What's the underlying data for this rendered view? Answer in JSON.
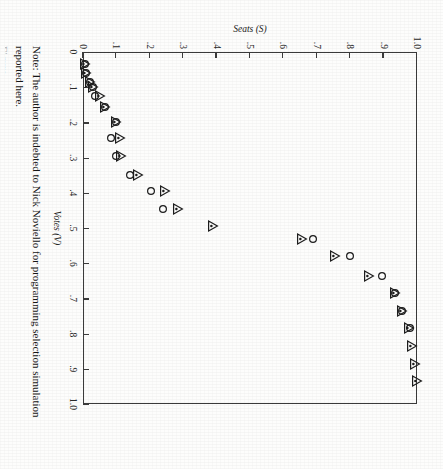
{
  "figure": {
    "note_line1": "Note: The author is indebted to Nick Noviello for programming selection simulation reported here.",
    "note_line2": "Figure"
  },
  "chart_data": {
    "type": "scatter",
    "title": "",
    "xlabel": "Votes (V)",
    "ylabel": "Seats (S)",
    "xlim": [
      0,
      1.0
    ],
    "ylim": [
      0,
      1.0
    ],
    "grid": false,
    "legend": "none",
    "xticks": [
      0,
      0.1,
      0.2,
      0.3,
      0.4,
      0.5,
      0.6,
      0.7,
      0.8,
      0.9,
      1.0
    ],
    "yticks": [
      0,
      0.1,
      0.2,
      0.3,
      0.4,
      0.5,
      0.6,
      0.7,
      0.8,
      0.9,
      1.0
    ],
    "xticklabels": [
      "0",
      ".1",
      ".2",
      ".3",
      ".4",
      ".5",
      ".6",
      ".7",
      ".8",
      ".9",
      "1.0"
    ],
    "yticklabels": [
      "0",
      ".1",
      ".2",
      ".3",
      ".4",
      ".5",
      ".6",
      ".7",
      ".8",
      ".9",
      "1.0"
    ],
    "series": [
      {
        "name": "triangle-series",
        "marker": "triangle-dot",
        "points": [
          [
            0.035,
            0.005
          ],
          [
            0.06,
            0.01
          ],
          [
            0.085,
            0.02
          ],
          [
            0.1,
            0.03
          ],
          [
            0.125,
            0.05
          ],
          [
            0.155,
            0.065
          ],
          [
            0.2,
            0.1
          ],
          [
            0.245,
            0.11
          ],
          [
            0.295,
            0.115
          ],
          [
            0.35,
            0.165
          ],
          [
            0.395,
            0.245
          ],
          [
            0.445,
            0.285
          ],
          [
            0.495,
            0.39
          ],
          [
            0.53,
            0.655
          ],
          [
            0.58,
            0.755
          ],
          [
            0.635,
            0.855
          ],
          [
            0.685,
            0.935
          ],
          [
            0.735,
            0.955
          ],
          [
            0.785,
            0.975
          ],
          [
            0.835,
            0.985
          ],
          [
            0.885,
            0.995
          ],
          [
            0.935,
            1.0
          ]
        ]
      },
      {
        "name": "circle-series",
        "marker": "open-circle",
        "points": [
          [
            0.035,
            0.005
          ],
          [
            0.06,
            0.01
          ],
          [
            0.085,
            0.02
          ],
          [
            0.1,
            0.03
          ],
          [
            0.125,
            0.035
          ],
          [
            0.155,
            0.065
          ],
          [
            0.2,
            0.1
          ],
          [
            0.245,
            0.085
          ],
          [
            0.295,
            0.1
          ],
          [
            0.35,
            0.14
          ],
          [
            0.395,
            0.205
          ],
          [
            0.445,
            0.24
          ],
          [
            0.53,
            0.69
          ],
          [
            0.58,
            0.8
          ],
          [
            0.635,
            0.895
          ],
          [
            0.685,
            0.935
          ],
          [
            0.735,
            0.955
          ],
          [
            0.785,
            0.98
          ]
        ]
      }
    ]
  }
}
